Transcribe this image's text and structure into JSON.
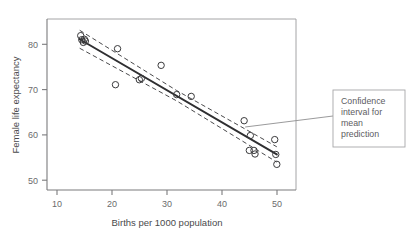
{
  "chart_data": {
    "type": "scatter",
    "title": "",
    "xlabel": "Births per 1000 population",
    "ylabel": "Female life expectancy",
    "xlim": [
      6,
      54
    ],
    "ylim": [
      47.5,
      85.5
    ],
    "xticks": [
      10,
      20,
      30,
      40,
      50
    ],
    "yticks": [
      50,
      60,
      70,
      80
    ],
    "grid": false,
    "legend": null,
    "points": [
      {
        "x": 12.5,
        "y": 81.8
      },
      {
        "x": 12.7,
        "y": 80.9
      },
      {
        "x": 13.0,
        "y": 80.3
      },
      {
        "x": 13.2,
        "y": 81.0
      },
      {
        "x": 13.4,
        "y": 80.6
      },
      {
        "x": 19.2,
        "y": 70.9
      },
      {
        "x": 19.6,
        "y": 78.9
      },
      {
        "x": 23.8,
        "y": 72.0
      },
      {
        "x": 24.2,
        "y": 72.3
      },
      {
        "x": 28.0,
        "y": 75.2
      },
      {
        "x": 31.0,
        "y": 68.7
      },
      {
        "x": 33.8,
        "y": 68.3
      },
      {
        "x": 44.0,
        "y": 62.9
      },
      {
        "x": 45.2,
        "y": 59.6
      },
      {
        "x": 45.0,
        "y": 56.3
      },
      {
        "x": 45.9,
        "y": 56.3
      },
      {
        "x": 46.1,
        "y": 55.5
      },
      {
        "x": 49.9,
        "y": 58.7
      },
      {
        "x": 50.1,
        "y": 55.4
      },
      {
        "x": 50.3,
        "y": 53.2
      }
    ],
    "fit_line": {
      "label": "fitted regression line",
      "x_start": 12.3,
      "y_start": 81.0,
      "x_end": 50.3,
      "y_end": 55.4
    },
    "confidence_band": {
      "label": "Confidence interval for mean prediction",
      "style": "dashed",
      "upper": [
        {
          "x": 12.3,
          "y": 83.0
        },
        {
          "x": 31.0,
          "y": 69.6
        },
        {
          "x": 50.3,
          "y": 57.1
        }
      ],
      "lower": [
        {
          "x": 12.3,
          "y": 79.0
        },
        {
          "x": 31.0,
          "y": 67.3
        },
        {
          "x": 50.3,
          "y": 53.7
        }
      ]
    },
    "annotations": [
      {
        "name": "confidence-interval-callout",
        "text": "Confidence interval for mean prediction",
        "lines": [
          "Confidence",
          "interval for",
          "mean",
          "prediction"
        ],
        "target": {
          "x": 44.2,
          "y": 61.5
        }
      }
    ]
  },
  "colors": {
    "point_stroke": "#3a3a3c",
    "fit_line": "#2f2f31",
    "ci_line": "#4a4a4c",
    "axis": "#7b7b7d",
    "panel_border": "#9a9a9c",
    "callout_border": "#a6a6a8",
    "text": "#58585a",
    "background": "#ffffff"
  }
}
